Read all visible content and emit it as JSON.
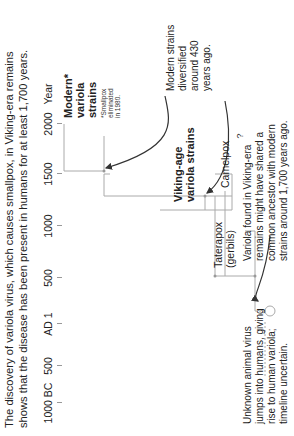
{
  "title": {
    "line1": "The discovery of variola virus, which causes smallpox, in Viking-era remains",
    "line2": "shows that the disease has been present in humans for at least 1,700 years."
  },
  "axis": {
    "ticks": [
      {
        "label": "1000 BC",
        "x": 33
      },
      {
        "label": "500",
        "x": 70
      },
      {
        "label": "AD 1",
        "x": 112
      },
      {
        "label": "500",
        "x": 158
      },
      {
        "label": "1000",
        "x": 210
      },
      {
        "label": "1500",
        "x": 262
      },
      {
        "label": "2000",
        "x": 312
      }
    ],
    "unit_label": "Year"
  },
  "tree": {
    "modern": {
      "line1": "Modern*",
      "line2": "variola",
      "line3": "strains",
      "footnote": [
        "*Smallpox",
        "eliminated",
        "in 1980."
      ]
    },
    "viking": {
      "line1": "Viking-age",
      "line2": "variola strains"
    },
    "camelpox": "Camelpox",
    "taterapox": {
      "line1": "Taterapox",
      "line2": "(gerbils)"
    },
    "root_symbol": "?"
  },
  "annotations": {
    "modern_diversified": [
      "Modern strains",
      "diversified",
      "around 430",
      "years ago."
    ],
    "viking_ancestor": [
      "Variola found in Viking-era",
      "remains might have shared a",
      "common ancestor with modern",
      "strains around 1,700 years ago."
    ],
    "unknown_jump": [
      "Unknown animal virus",
      "jumps into humans, giving",
      "rise to human variola;",
      "timeline uncertain."
    ]
  },
  "colors": {
    "line": "#aaaaaa",
    "arrow": "#333333",
    "text": "#222222"
  }
}
